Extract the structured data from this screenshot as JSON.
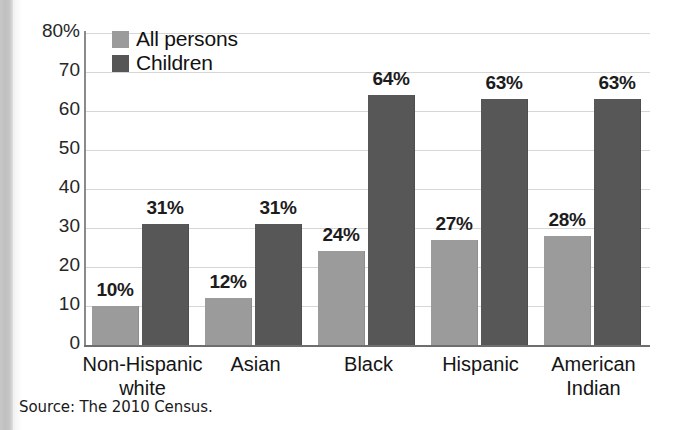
{
  "chart_data": {
    "type": "bar",
    "title": "",
    "xlabel": "",
    "ylabel": "",
    "ylim": [
      0,
      80
    ],
    "grid": true,
    "legend_position": "top-left",
    "categories": [
      "Non-Hispanic white",
      "Asian",
      "Black",
      "Hispanic",
      "American Indian"
    ],
    "category_lines": [
      [
        "Non-Hispanic",
        "white"
      ],
      [
        "Asian"
      ],
      [
        "Black"
      ],
      [
        "Hispanic"
      ],
      [
        "American",
        "Indian"
      ]
    ],
    "series": [
      {
        "name": "All persons",
        "color": "#9b9b9b",
        "values": [
          10,
          12,
          24,
          27,
          28
        ],
        "labels": [
          "10%",
          "12%",
          "24%",
          "27%",
          "28%"
        ]
      },
      {
        "name": "Children",
        "color": "#565656",
        "values": [
          31,
          31,
          64,
          63,
          63
        ],
        "labels": [
          "31%",
          "31%",
          "64%",
          "63%",
          "63%"
        ]
      }
    ],
    "yticks": [
      80,
      70,
      60,
      50,
      40,
      30,
      20,
      10,
      0
    ],
    "ytick_labels": [
      "80%",
      "70",
      "60",
      "50",
      "40",
      "30",
      "20",
      "10",
      "0"
    ],
    "source": "Source: The 2010 Census."
  },
  "legend": {
    "items": [
      {
        "label": "All persons",
        "swatch": "#9b9b9b"
      },
      {
        "label": "Children",
        "swatch": "#565656"
      }
    ]
  },
  "colors": {
    "bar_all_persons": "#9b9b9b",
    "bar_children": "#565656",
    "gridline": "#d6d6d6",
    "axis": "#6e6e6e",
    "text": "#151515",
    "background": "#ffffff"
  }
}
